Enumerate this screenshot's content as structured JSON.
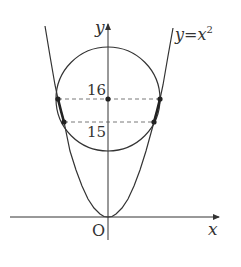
{
  "diagram": {
    "type": "graph",
    "curve_label": "y=x",
    "curve_label_exponent": "2",
    "axis_x_label": "x",
    "axis_y_label": "y",
    "origin_label": "O",
    "tick_labels": [
      "16",
      "15"
    ],
    "colors": {
      "stroke": "#333333",
      "dashed": "#555555",
      "background": "#ffffff"
    },
    "elements": [
      "parabola y=x^2",
      "circle centered on y-axis at y=16",
      "dashed horizontal line at y=16 through circle center",
      "dashed horizontal line at y=15",
      "points of intersection marked with dots",
      "thickened arcs of parabola between y=15 and y=16"
    ]
  }
}
